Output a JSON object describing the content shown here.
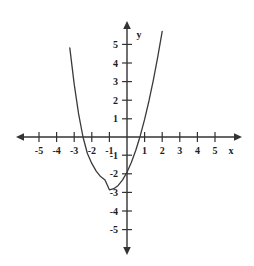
{
  "figure": {
    "top_caption": "",
    "background_color": "#ffffff",
    "axis_color": "#333333",
    "curve_color": "#3a3a3a",
    "label_color": "#1d1d1d"
  },
  "axes": {
    "x_axis_label": "x",
    "y_axis_label": "y",
    "x_ticks": [
      -5,
      -4,
      -3,
      -2,
      -1,
      1,
      2,
      3,
      4,
      5
    ],
    "y_ticks": [
      5,
      4,
      3,
      2,
      1,
      -1,
      -2,
      -3,
      -4,
      -5
    ],
    "x_tick_labels": [
      "-5",
      "-4",
      "-3",
      "-2",
      "-1",
      "1",
      "2",
      "3",
      "4",
      "5"
    ],
    "y_tick_labels": [
      "5",
      "4",
      "3",
      "2",
      "1",
      "-1",
      "-2",
      "-3",
      "-4",
      "-5"
    ],
    "origin_label": ""
  },
  "chart_data": {
    "type": "line",
    "title": "",
    "xlabel": "x",
    "ylabel": "y",
    "xlim": [
      -5.6,
      5.6
    ],
    "ylim": [
      -5.6,
      5.6
    ],
    "grid": false,
    "legend": "none",
    "series": [
      {
        "name": "parabola",
        "equation": "y = x^2 + 2x - 2",
        "vertex": [
          -1,
          -3
        ],
        "opens": "up",
        "x_intercepts": [
          -3.65,
          1.65
        ],
        "y_intercept": -2,
        "x": [
          -3.25,
          -3.0,
          -2.75,
          -2.5,
          -2.25,
          -2.0,
          -1.75,
          -1.5,
          -1.25,
          -1.0,
          -0.75,
          -0.5,
          -0.25,
          0.0,
          0.25,
          0.5,
          0.75,
          1.0,
          1.25,
          1.5,
          1.75,
          2.0,
          2.25
        ],
        "y": [
          5.06,
          3.0,
          1.31,
          0.0,
          -0.94,
          -1.5,
          -1.94,
          -2.25,
          -2.44,
          -3.0,
          -2.94,
          -2.75,
          -2.44,
          -2.0,
          -1.44,
          -0.75,
          0.06,
          1.0,
          2.06,
          3.25,
          4.56,
          6.0,
          7.56
        ]
      }
    ]
  }
}
